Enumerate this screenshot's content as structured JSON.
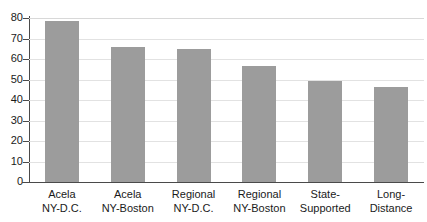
{
  "chart_data": {
    "type": "bar",
    "title": "",
    "subtitle": "",
    "xlabel": "",
    "ylabel": "",
    "ylim": [
      0,
      80
    ],
    "ytick_step": 10,
    "yticks": [
      "80",
      "70",
      "60",
      "50",
      "40",
      "30",
      "20",
      "10",
      "0"
    ],
    "grid": "horizontal",
    "legend": "none",
    "bar_color": "#9c9c9c",
    "axis_color": "#4a4a4a",
    "gridline_color": "#e2e2e2",
    "categories": [
      "Acela\nNY-D.C.",
      "Acela\nNY-Boston",
      "Regional\nNY-D.C.",
      "Regional\nNY-Boston",
      "State-\nSupported",
      "Long-\nDistance"
    ],
    "category_lines": [
      [
        "Acela",
        "NY-D.C."
      ],
      [
        "Acela",
        "NY-Boston"
      ],
      [
        "Regional",
        "NY-D.C."
      ],
      [
        "Regional",
        "NY-Boston"
      ],
      [
        "State-",
        "Supported"
      ],
      [
        "Long-",
        "Distance"
      ]
    ],
    "values": [
      78.5,
      66.0,
      64.7,
      56.5,
      49.4,
      46.5
    ]
  }
}
